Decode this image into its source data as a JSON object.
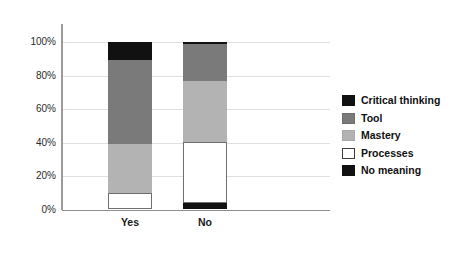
{
  "chart_data": {
    "type": "bar",
    "subtype": "stacked-100-percent",
    "title": "",
    "xlabel": "",
    "ylabel": "",
    "categories": [
      "Yes",
      "No"
    ],
    "ylim": [
      0,
      100
    ],
    "ytick_labels": [
      "0%",
      "20%",
      "40%",
      "60%",
      "80%",
      "100%"
    ],
    "ytick_values": [
      0,
      20,
      40,
      60,
      80,
      100
    ],
    "grid": true,
    "legend_position": "right",
    "stack_order_bottom_to_top": [
      "No meaning",
      "Processes",
      "Mastery",
      "Tool",
      "Critical thinking"
    ],
    "series": [
      {
        "name": "Critical thinking",
        "color": "#111111",
        "values": [
          11,
          1
        ]
      },
      {
        "name": "Tool",
        "color": "#7a7a7a",
        "values": [
          50,
          22
        ]
      },
      {
        "name": "Mastery",
        "color": "#b3b3b3",
        "values": [
          29,
          37
        ]
      },
      {
        "name": "Processes",
        "color": "#ffffff",
        "values": [
          10,
          36
        ]
      },
      {
        "name": "No meaning",
        "color": "#111111",
        "values": [
          0,
          4
        ]
      }
    ]
  },
  "axis": {
    "y_ticks": [
      {
        "label": "100%",
        "value": 100
      },
      {
        "label": "80%",
        "value": 80
      },
      {
        "label": "60%",
        "value": 60
      },
      {
        "label": "40%",
        "value": 40
      },
      {
        "label": "20%",
        "value": 20
      },
      {
        "label": "0%",
        "value": 0
      }
    ],
    "x_ticks": [
      {
        "label": "Yes"
      },
      {
        "label": "No"
      }
    ]
  },
  "legend": {
    "items": [
      {
        "label": "Critical thinking",
        "color": "#111111",
        "border": "#111111"
      },
      {
        "label": "Tool",
        "color": "#7a7a7a",
        "border": "#6e6e6e"
      },
      {
        "label": "Mastery",
        "color": "#b3b3b3",
        "border": "#a8a8a8"
      },
      {
        "label": "Processes",
        "color": "#ffffff",
        "border": "#3c3c3c"
      },
      {
        "label": "No meaning",
        "color": "#111111",
        "border": "#111111"
      }
    ]
  },
  "colors": {
    "gridline": "#dfdfdf",
    "axis": "#8e8e8e",
    "background": "#ffffff",
    "text": "#111111"
  }
}
